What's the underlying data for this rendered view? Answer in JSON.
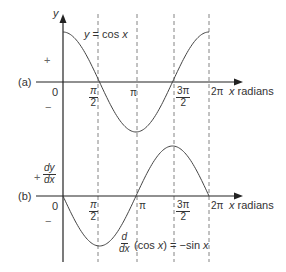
{
  "chart_data": [
    {
      "panel": "(a)",
      "type": "line",
      "title": "",
      "curve_label": "y = cos x",
      "xlabel": "x radians",
      "ylabel": "y",
      "x_ticks": [
        "0",
        "π/2",
        "π",
        "3π/2",
        "2π"
      ],
      "x": [
        0,
        0.7854,
        1.5708,
        2.3562,
        3.1416,
        3.927,
        4.7124,
        5.4978,
        6.2832
      ],
      "values": [
        1,
        0.707,
        0,
        -0.707,
        -1,
        -0.707,
        0,
        0.707,
        1
      ],
      "sign_labels": [
        "+",
        "−"
      ],
      "ylim": [
        -1,
        1
      ],
      "grid": "dashed verticals at π/2, π, 3π/2, 2π"
    },
    {
      "panel": "(b)",
      "type": "line",
      "title": "",
      "curve_label": "d/dx (cos x) = −sin x",
      "xlabel": "x radians",
      "ylabel": "dy/dx",
      "x_ticks": [
        "0",
        "π/2",
        "π",
        "3π/2",
        "2π"
      ],
      "x": [
        0,
        0.7854,
        1.5708,
        2.3562,
        3.1416,
        3.927,
        4.7124,
        5.4978,
        6.2832
      ],
      "values": [
        0,
        -0.707,
        -1,
        -0.707,
        0,
        0.707,
        1,
        0.707,
        0
      ],
      "sign_labels": [
        "+",
        "−"
      ],
      "ylim": [
        -1,
        1
      ],
      "grid": "dashed verticals at π/2, π, 3π/2, 2π"
    }
  ],
  "labels": {
    "panel_a": "(a)",
    "panel_b": "(b)",
    "y_axis": "y",
    "plus": "+",
    "minus": "−",
    "zero": "0",
    "pi": "π",
    "two_pi": "2π",
    "pi_num": "π",
    "three_pi_num": "3π",
    "den_two": "2",
    "x_radians_var": "x",
    "x_radians_word": " radians",
    "cos_label_y": "y",
    "cos_label_rest": " = cos ",
    "cos_label_x": "x",
    "dy": "dy",
    "dx": "dx",
    "d": "d",
    "dx2": "dx",
    "deriv_mid": " (cos ",
    "deriv_x": "x",
    "deriv_rest": ") = −sin ",
    "deriv_x2": "x"
  }
}
